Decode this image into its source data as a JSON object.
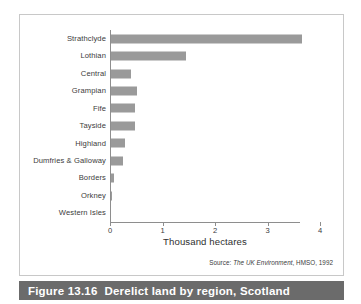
{
  "caption": {
    "number": "Figure 13.16",
    "text": "Derelict land by region, Scotland"
  },
  "source": {
    "prefix": "Source:",
    "italic_title": "The UK Environment",
    "suffix": ", HMSO, 1992"
  },
  "colors": {
    "bar_fill": "#9a9a9a",
    "axis": "#8e8e8e",
    "frame": "#c8c8c8",
    "caption_bar": "#6b6b6b",
    "caption_text": "#ffffff",
    "label_text": "#3b3b3b"
  },
  "chart_data": {
    "type": "bar",
    "orientation": "horizontal",
    "title": "",
    "subtitle": "",
    "xlabel": "Thousand hectares",
    "ylabel": "",
    "xlim": [
      0,
      4
    ],
    "xticks": [
      "0",
      "1",
      "2",
      "3",
      "4"
    ],
    "xtick_values": [
      0,
      1,
      2,
      3,
      4
    ],
    "grid": false,
    "legend": null,
    "categories": [
      "Strathclyde",
      "Lothian",
      "Central",
      "Grampian",
      "Fife",
      "Tayside",
      "Highland",
      "Dumfries & Galloway",
      "Borders",
      "Orkney",
      "Western Isles"
    ],
    "values": [
      3.65,
      1.45,
      0.4,
      0.52,
      0.47,
      0.47,
      0.29,
      0.25,
      0.07,
      0.04,
      0.0
    ],
    "units": "thousand hectares"
  }
}
